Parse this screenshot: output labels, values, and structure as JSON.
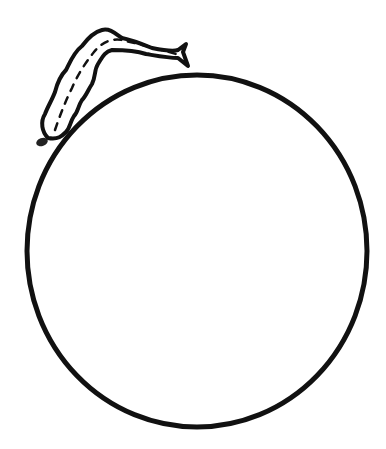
{
  "scene": {
    "description": "Line drawing of a caterpillar crawling on top of a large circle",
    "background_color": "#ffffff",
    "stroke_color": "#111111",
    "objects": [
      {
        "name": "circle",
        "center": [
          197,
          250
        ],
        "rx": 170,
        "ry": 177,
        "stroke_width": 5
      },
      {
        "name": "caterpillar",
        "head": [
          40,
          143
        ],
        "tail": [
          186,
          52
        ]
      }
    ]
  }
}
